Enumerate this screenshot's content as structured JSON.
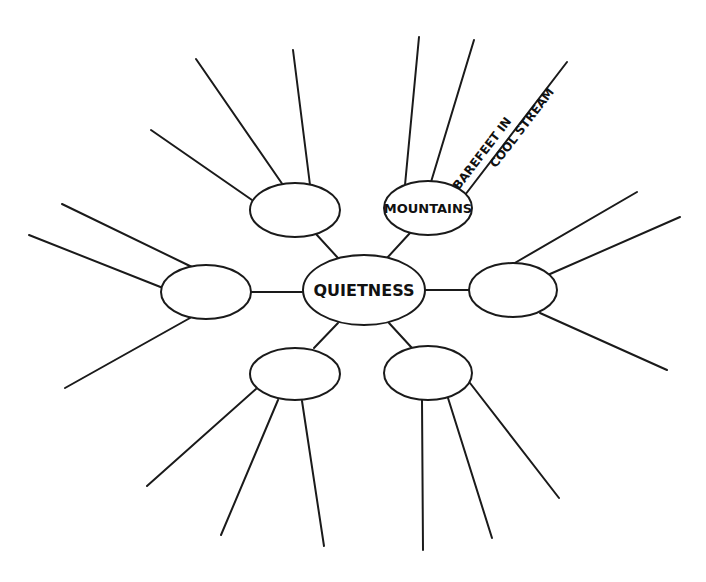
{
  "diagram": {
    "type": "web-map",
    "center": {
      "label": "QUIETNESS",
      "cx": 364,
      "cy": 290,
      "rx": 61,
      "ry": 35
    },
    "colors": {
      "ink": "#1a1a1a",
      "background": "#ffffff"
    },
    "nodes": [
      {
        "id": "top-left",
        "label": "",
        "cx": 295,
        "cy": 210,
        "rx": 45,
        "ry": 27,
        "connector": [
          316,
          234,
          338,
          258
        ],
        "spokes": [
          [
            283,
            185,
            196,
            59
          ],
          [
            252,
            200,
            151,
            130
          ],
          [
            310,
            185,
            293,
            50
          ]
        ]
      },
      {
        "id": "top-right",
        "label": "MOUNTAINS",
        "cx": 428,
        "cy": 208,
        "rx": 44,
        "ry": 27,
        "connector": [
          410,
          233,
          387,
          258
        ],
        "spokes": [
          [
            405,
            185,
            419,
            37
          ],
          [
            431,
            182,
            474,
            40
          ]
        ],
        "branch_label": {
          "line1": "BAREFEET IN",
          "line2": "COOL STREAM",
          "line": [
            465,
            195,
            567,
            62
          ]
        }
      },
      {
        "id": "left",
        "label": "",
        "cx": 206,
        "cy": 292,
        "rx": 45,
        "ry": 27,
        "connector": [
          251,
          292,
          302,
          292
        ],
        "spokes": [
          [
            192,
            267,
            62,
            204
          ],
          [
            163,
            288,
            29,
            235
          ],
          [
            190,
            318,
            65,
            388
          ]
        ]
      },
      {
        "id": "right",
        "label": "",
        "cx": 513,
        "cy": 290,
        "rx": 44,
        "ry": 27,
        "connector": [
          425,
          290,
          469,
          290
        ],
        "spokes": [
          [
            513,
            264,
            637,
            192
          ],
          [
            550,
            274,
            680,
            217
          ],
          [
            540,
            313,
            667,
            370
          ]
        ]
      },
      {
        "id": "bottom-left",
        "label": "",
        "cx": 295,
        "cy": 374,
        "rx": 45,
        "ry": 26,
        "connector": [
          338,
          323,
          314,
          348
        ],
        "spokes": [
          [
            256,
            389,
            147,
            486
          ],
          [
            278,
            400,
            221,
            535
          ],
          [
            302,
            401,
            324,
            546
          ]
        ]
      },
      {
        "id": "bottom-right",
        "label": "",
        "cx": 428,
        "cy": 373,
        "rx": 44,
        "ry": 27,
        "connector": [
          389,
          323,
          412,
          348
        ],
        "spokes": [
          [
            422,
            400,
            423,
            550
          ],
          [
            448,
            398,
            492,
            538
          ],
          [
            470,
            383,
            559,
            498
          ]
        ]
      }
    ]
  }
}
